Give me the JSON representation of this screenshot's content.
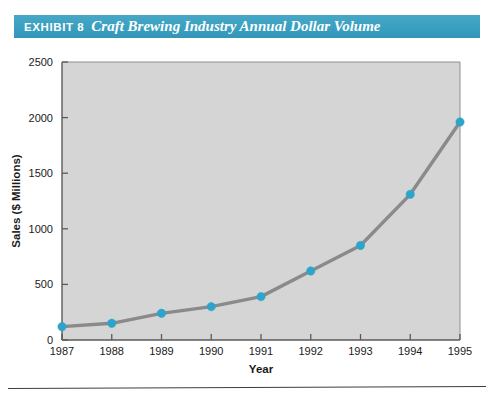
{
  "header": {
    "exhibit_label": "EXHIBIT 8",
    "title": "Craft Brewing Industry Annual Dollar Volume",
    "band_color": "#3a9fc0",
    "text_color": "#ffffff"
  },
  "chart_data": {
    "type": "line",
    "title": "Craft Brewing Industry Annual Dollar Volume",
    "xlabel": "Year",
    "ylabel": "Sales ($ Millions)",
    "categories": [
      "1987",
      "1988",
      "1989",
      "1990",
      "1991",
      "1992",
      "1993",
      "1994",
      "1995"
    ],
    "x": [
      1987,
      1988,
      1989,
      1990,
      1991,
      1992,
      1993,
      1994,
      1995
    ],
    "values": [
      120,
      150,
      240,
      300,
      390,
      620,
      850,
      1310,
      1960
    ],
    "series": [
      {
        "name": "Sales ($ Millions)",
        "values": [
          120,
          150,
          240,
          300,
          390,
          620,
          850,
          1310,
          1960
        ]
      }
    ],
    "xlim": [
      1987,
      1995
    ],
    "ylim": [
      0,
      2500
    ],
    "ytick_labels": [
      "0",
      "500",
      "1000",
      "1500",
      "2000",
      "2500"
    ],
    "ytick_values": [
      0,
      500,
      1000,
      1500,
      2000,
      2500
    ],
    "xtick_labels": [
      "1987",
      "1988",
      "1989",
      "1990",
      "1991",
      "1992",
      "1993",
      "1994",
      "1995"
    ],
    "grid": false,
    "legend": "none",
    "plot_background": "#d5d5d5",
    "line_color": "#8a8a8a",
    "marker_color": "#2da5cb",
    "axis_color": "#555555"
  },
  "axes": {
    "y_label": "Sales ($ Millions)",
    "x_label": "Year",
    "y_ticks": [
      "2500",
      "2000",
      "1500",
      "1000",
      "500",
      "0"
    ],
    "x_ticks": [
      "1987",
      "1988",
      "1989",
      "1990",
      "1991",
      "1992",
      "1993",
      "1994",
      "1995"
    ]
  }
}
